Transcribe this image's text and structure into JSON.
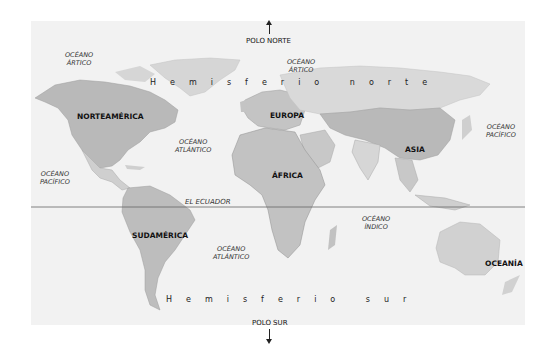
{
  "map": {
    "title": "Mapa del mundo: hemisferios",
    "poles": {
      "north": "POLO NORTE",
      "south": "POLO SUR"
    },
    "hemispheres": {
      "north": "Hemisferio norte",
      "south": "Hemisferio sur"
    },
    "equator": "EL ECUADOR",
    "continents": {
      "north_america": "NORTEAMÉRICA",
      "south_america": "SUDAMÉRICA",
      "europe": "EUROPA",
      "africa": "ÁFRICA",
      "asia": "ASIA",
      "oceania": "OCEANÍA"
    },
    "oceans": {
      "arctic_west": [
        "OCÉANO",
        "ÁRTICO"
      ],
      "arctic_east": [
        "OCÉANO",
        "ÁRTICO"
      ],
      "pacific_west": [
        "OCÉANO",
        "PACÍFICO"
      ],
      "pacific_east": [
        "OCÉANO",
        "PACÍFICO"
      ],
      "atlantic_north": [
        "OCÉANO",
        "ATLÁNTICO"
      ],
      "atlantic_south": [
        "OCÉANO",
        "ATLÁNTICO"
      ],
      "indian": [
        "OCÉANO",
        "ÍNDICO"
      ]
    },
    "colors": {
      "background": "#ffffff",
      "ocean": "#f2f2f2",
      "land_light": "#d9d9d9",
      "land_mid": "#bdbdbd",
      "land_dark": "#a8a8a8",
      "equator_line": "#666666"
    }
  }
}
